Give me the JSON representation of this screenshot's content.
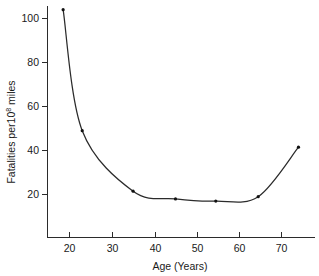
{
  "chart_data": {
    "type": "line",
    "title": "",
    "subtitle": "",
    "xlabel": "Age (Years)",
    "ylabel": "Fatalities per10⁸ miles",
    "ylabel_prefix": "Fatalities per10",
    "ylabel_superscript": "8",
    "ylabel_suffix": " miles",
    "grid": false,
    "legend": false,
    "legend_position": "none",
    "xlim": [
      14,
      78
    ],
    "ylim": [
      0,
      112
    ],
    "xticks": [
      20,
      30,
      40,
      50,
      60,
      70
    ],
    "xtick_labels": [
      "20",
      "30",
      "40",
      "50",
      "60",
      "70"
    ],
    "yticks": [
      20,
      40,
      60,
      80,
      100
    ],
    "ytick_labels": [
      "20",
      "40",
      "60",
      "80",
      "100"
    ],
    "x": [
      18.5,
      23,
      35,
      45,
      54.5,
      64.5,
      74
    ],
    "values": [
      104,
      49,
      21.5,
      18,
      17,
      19,
      41.5
    ],
    "series": [
      {
        "name": "Fatalities per 10^8 miles",
        "x": [
          18.5,
          23,
          35,
          45,
          54.5,
          64.5,
          74
        ],
        "values": [
          104,
          49,
          21.5,
          18,
          17,
          19,
          41.5
        ],
        "marker": "dot",
        "color": "#2b2b2b"
      }
    ],
    "annotations": []
  },
  "colors": {
    "background": "#ffffff",
    "axis": "#2b2b2b",
    "curve": "#2b2b2b",
    "marker": "#111111",
    "text": "#1a1a1a"
  }
}
